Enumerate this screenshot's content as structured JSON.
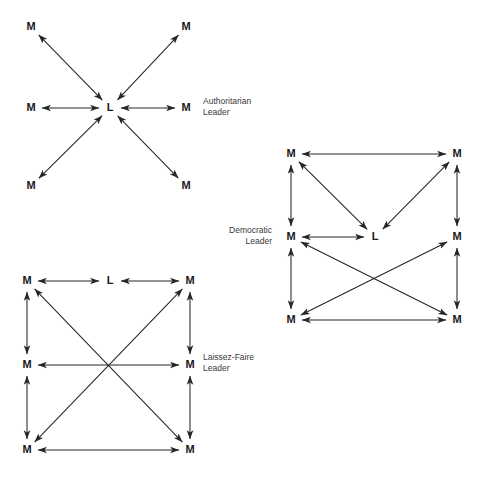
{
  "figure": {
    "background_color": "#ffffff",
    "line_color": "#262626",
    "text_color": "#1a1a1a",
    "caption_color": "#3a3a3a",
    "width": 483,
    "height": 477
  },
  "diagrams": [
    {
      "id": "authoritarian",
      "caption_line1": "Authoritarian",
      "caption_line2": "Leader",
      "caption_x": 203,
      "caption_y": 104,
      "caption_align": "start",
      "leader_label": "L",
      "member_label": "M",
      "nodes": [
        {
          "name": "leader",
          "label": "L",
          "x": 110,
          "y": 108
        },
        {
          "name": "member-nw",
          "label": "M",
          "x": 31,
          "y": 27
        },
        {
          "name": "member-ne",
          "label": "M",
          "x": 186,
          "y": 27
        },
        {
          "name": "member-w",
          "label": "M",
          "x": 31,
          "y": 108
        },
        {
          "name": "member-e",
          "label": "M",
          "x": 186,
          "y": 108
        },
        {
          "name": "member-sw",
          "label": "M",
          "x": 31,
          "y": 186
        },
        {
          "name": "member-se",
          "label": "M",
          "x": 186,
          "y": 186
        }
      ],
      "edges": [
        {
          "name": "edge-leader-member-nw",
          "from": "leader",
          "to": "member-nw",
          "arrows": "both"
        },
        {
          "name": "edge-leader-member-ne",
          "from": "leader",
          "to": "member-ne",
          "arrows": "both"
        },
        {
          "name": "edge-leader-member-w",
          "from": "leader",
          "to": "member-w",
          "arrows": "both"
        },
        {
          "name": "edge-leader-member-e",
          "from": "leader",
          "to": "member-e",
          "arrows": "both"
        },
        {
          "name": "edge-leader-member-sw",
          "from": "leader",
          "to": "member-sw",
          "arrows": "both"
        },
        {
          "name": "edge-leader-member-se",
          "from": "leader",
          "to": "member-se",
          "arrows": "both"
        }
      ]
    },
    {
      "id": "democratic",
      "caption_line1": "Democratic",
      "caption_line2": "Leader",
      "caption_x": 272,
      "caption_y": 233,
      "caption_align": "end",
      "leader_label": "L",
      "member_label": "M",
      "nodes": [
        {
          "name": "member-tl",
          "label": "M",
          "x": 291,
          "y": 154
        },
        {
          "name": "member-tr",
          "label": "M",
          "x": 457,
          "y": 154
        },
        {
          "name": "member-ml",
          "label": "M",
          "x": 291,
          "y": 237
        },
        {
          "name": "leader",
          "label": "L",
          "x": 375,
          "y": 237
        },
        {
          "name": "member-mr",
          "label": "M",
          "x": 457,
          "y": 237
        },
        {
          "name": "member-bl",
          "label": "M",
          "x": 291,
          "y": 320
        },
        {
          "name": "member-br",
          "label": "M",
          "x": 457,
          "y": 320
        }
      ],
      "edges": [
        {
          "name": "edge-tl-tr",
          "from": "member-tl",
          "to": "member-tr",
          "arrows": "both"
        },
        {
          "name": "edge-tl-ml",
          "from": "member-tl",
          "to": "member-ml",
          "arrows": "both"
        },
        {
          "name": "edge-tr-mr",
          "from": "member-tr",
          "to": "member-mr",
          "arrows": "both"
        },
        {
          "name": "edge-tl-leader",
          "from": "member-tl",
          "to": "leader",
          "arrows": "both"
        },
        {
          "name": "edge-tr-leader",
          "from": "member-tr",
          "to": "leader",
          "arrows": "both"
        },
        {
          "name": "edge-ml-leader",
          "from": "member-ml",
          "to": "leader",
          "arrows": "both"
        },
        {
          "name": "edge-ml-bl",
          "from": "member-ml",
          "to": "member-bl",
          "arrows": "both"
        },
        {
          "name": "edge-mr-br",
          "from": "member-mr",
          "to": "member-br",
          "arrows": "both"
        },
        {
          "name": "edge-ml-br",
          "from": "member-ml",
          "to": "member-br",
          "arrows": "both"
        },
        {
          "name": "edge-mr-bl",
          "from": "member-mr",
          "to": "member-bl",
          "arrows": "both"
        },
        {
          "name": "edge-bl-br",
          "from": "member-bl",
          "to": "member-br",
          "arrows": "both"
        }
      ]
    },
    {
      "id": "laissez-faire",
      "caption_line1": "Laissez-Faire",
      "caption_line2": "Leader",
      "caption_x": 203,
      "caption_y": 360,
      "caption_align": "start",
      "leader_label": "L",
      "member_label": "M",
      "nodes": [
        {
          "name": "member-tl",
          "label": "M",
          "x": 27,
          "y": 281
        },
        {
          "name": "leader",
          "label": "L",
          "x": 110,
          "y": 281
        },
        {
          "name": "member-tr",
          "label": "M",
          "x": 190,
          "y": 281
        },
        {
          "name": "member-ml",
          "label": "M",
          "x": 27,
          "y": 365
        },
        {
          "name": "member-mr",
          "label": "M",
          "x": 190,
          "y": 365
        },
        {
          "name": "member-bl",
          "label": "M",
          "x": 27,
          "y": 450
        },
        {
          "name": "member-br",
          "label": "M",
          "x": 190,
          "y": 450
        }
      ],
      "edges": [
        {
          "name": "edge-tl-leader",
          "from": "member-tl",
          "to": "leader",
          "arrows": "both"
        },
        {
          "name": "edge-leader-tr",
          "from": "leader",
          "to": "member-tr",
          "arrows": "both"
        },
        {
          "name": "edge-tl-ml",
          "from": "member-tl",
          "to": "member-ml",
          "arrows": "both"
        },
        {
          "name": "edge-tr-mr",
          "from": "member-tr",
          "to": "member-mr",
          "arrows": "both"
        },
        {
          "name": "edge-ml-mr",
          "from": "member-ml",
          "to": "member-mr",
          "arrows": "both"
        },
        {
          "name": "edge-ml-bl",
          "from": "member-ml",
          "to": "member-bl",
          "arrows": "both"
        },
        {
          "name": "edge-mr-br",
          "from": "member-mr",
          "to": "member-br",
          "arrows": "both"
        },
        {
          "name": "edge-bl-br",
          "from": "member-bl",
          "to": "member-br",
          "arrows": "both"
        },
        {
          "name": "edge-tl-br",
          "from": "member-tl",
          "to": "member-br",
          "arrows": "both"
        },
        {
          "name": "edge-tr-bl",
          "from": "member-tr",
          "to": "member-bl",
          "arrows": "both"
        }
      ]
    }
  ]
}
